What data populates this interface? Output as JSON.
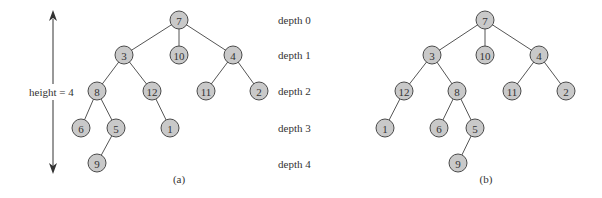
{
  "height_annotation": {
    "label": "height = 4"
  },
  "depth_labels": [
    "depth 0",
    "depth 1",
    "depth 2",
    "depth 3",
    "depth 4"
  ],
  "trees": [
    {
      "caption": "(a)",
      "nodes": [
        {
          "id": "a7",
          "label": "7",
          "x": 179,
          "y": 20
        },
        {
          "id": "a3",
          "label": "3",
          "x": 124,
          "y": 55
        },
        {
          "id": "a10",
          "label": "10",
          "x": 179,
          "y": 55
        },
        {
          "id": "a4",
          "label": "4",
          "x": 233,
          "y": 55
        },
        {
          "id": "a8",
          "label": "8",
          "x": 97,
          "y": 91
        },
        {
          "id": "a12",
          "label": "12",
          "x": 152,
          "y": 91
        },
        {
          "id": "a11",
          "label": "11",
          "x": 206,
          "y": 91
        },
        {
          "id": "a2",
          "label": "2",
          "x": 259,
          "y": 91
        },
        {
          "id": "a6",
          "label": "6",
          "x": 81,
          "y": 128
        },
        {
          "id": "a5",
          "label": "5",
          "x": 116,
          "y": 128
        },
        {
          "id": "a1",
          "label": "1",
          "x": 170,
          "y": 128
        },
        {
          "id": "a9",
          "label": "9",
          "x": 97,
          "y": 163
        }
      ],
      "edges": [
        [
          "a7",
          "a3"
        ],
        [
          "a7",
          "a10"
        ],
        [
          "a7",
          "a4"
        ],
        [
          "a3",
          "a8"
        ],
        [
          "a3",
          "a12"
        ],
        [
          "a4",
          "a11"
        ],
        [
          "a4",
          "a2"
        ],
        [
          "a8",
          "a6"
        ],
        [
          "a8",
          "a5"
        ],
        [
          "a12",
          "a1"
        ],
        [
          "a5",
          "a9"
        ]
      ]
    },
    {
      "caption": "(b)",
      "nodes": [
        {
          "id": "b7",
          "label": "7",
          "x": 485,
          "y": 20
        },
        {
          "id": "b3",
          "label": "3",
          "x": 432,
          "y": 55
        },
        {
          "id": "b10",
          "label": "10",
          "x": 485,
          "y": 55
        },
        {
          "id": "b4",
          "label": "4",
          "x": 539,
          "y": 55
        },
        {
          "id": "b12",
          "label": "12",
          "x": 404,
          "y": 91
        },
        {
          "id": "b8",
          "label": "8",
          "x": 457,
          "y": 91
        },
        {
          "id": "b11",
          "label": "11",
          "x": 512,
          "y": 91
        },
        {
          "id": "b2",
          "label": "2",
          "x": 566,
          "y": 91
        },
        {
          "id": "b1",
          "label": "1",
          "x": 385,
          "y": 128
        },
        {
          "id": "b6",
          "label": "6",
          "x": 439,
          "y": 128
        },
        {
          "id": "b5",
          "label": "5",
          "x": 475,
          "y": 128
        },
        {
          "id": "b9",
          "label": "9",
          "x": 458,
          "y": 163
        }
      ],
      "edges": [
        [
          "b7",
          "b3"
        ],
        [
          "b7",
          "b10"
        ],
        [
          "b7",
          "b4"
        ],
        [
          "b3",
          "b12"
        ],
        [
          "b3",
          "b8"
        ],
        [
          "b4",
          "b11"
        ],
        [
          "b4",
          "b2"
        ],
        [
          "b12",
          "b1"
        ],
        [
          "b8",
          "b6"
        ],
        [
          "b8",
          "b5"
        ],
        [
          "b5",
          "b9"
        ]
      ]
    }
  ],
  "colors": {
    "node_fill": "#c9c9c9",
    "node_stroke": "#4a4a4a",
    "edge": "#555555",
    "text": "#333333"
  }
}
